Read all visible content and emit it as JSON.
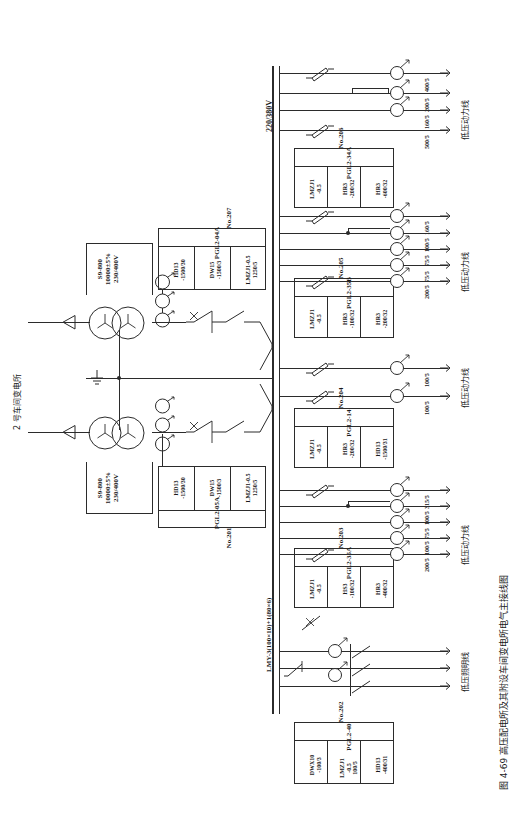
{
  "figure": {
    "caption": "图 4-69  高压配电所及其附设车间变电所电气主接线图",
    "source_label": "2 号车间变电所"
  },
  "bus": {
    "hv_label": "220/380V",
    "lv_bus_spec": "LMY-3(100×10)+1(80×6)"
  },
  "transformers": [
    {
      "id": "transformer-top",
      "model": "S9-800",
      "primary": "10000±5%",
      "secondary": "230/400V"
    },
    {
      "id": "transformer-bottom",
      "model": "S9-800",
      "primary": "10000±5%",
      "secondary": "230/400V"
    }
  ],
  "panels": [
    {
      "number": "No.207",
      "cabinet": "PGL2-04A",
      "devices": [
        {
          "type": "LMZJ1-0.5",
          "rating": "1250/5"
        },
        {
          "type": "DW15",
          "rating": "-1500/3"
        },
        {
          "type": "HD13",
          "rating": "-1500/30"
        }
      ]
    },
    {
      "number": "No.206",
      "cabinet": "PGL2-34A",
      "devices": [
        {
          "type": "HR3",
          "rating": "-600/32"
        },
        {
          "type": "HR3",
          "rating": "-200/32"
        },
        {
          "type": "LMZJ1",
          "rating": "-0.5"
        }
      ]
    },
    {
      "number": "No.205",
      "cabinet": "PGL2-35B",
      "devices": [
        {
          "type": "HR3",
          "rating": "-200/32"
        },
        {
          "type": "HR3",
          "rating": "-100/32"
        },
        {
          "type": "LMZJ1",
          "rating": "-0.5"
        }
      ]
    },
    {
      "number": "No.204",
      "cabinet": "PGL2-14",
      "devices": [
        {
          "type": "HD13",
          "rating": "-1500/31"
        },
        {
          "type": "HR3",
          "rating": "-200/32"
        },
        {
          "type": "LMZJ1",
          "rating": "-0.5"
        }
      ]
    },
    {
      "number": "No.203",
      "cabinet": "PGL2-35A",
      "devices": [
        {
          "type": "HR3",
          "rating": "-400/32"
        },
        {
          "type": "HS3",
          "rating": "-100/32"
        },
        {
          "type": "LMZJ1",
          "rating": "-0.5"
        }
      ]
    },
    {
      "number": "No.202",
      "cabinet": "PGL2-40",
      "devices": [
        {
          "type": "HD13",
          "rating": "-400/31"
        },
        {
          "type": "LMZJ1",
          "rating": "-0.5",
          "rating2": "100/5"
        },
        {
          "type": "DWX10",
          "rating": "-100/3"
        }
      ]
    },
    {
      "number": "No.201",
      "cabinet": "PGL2-05A",
      "devices": [
        {
          "type": "LMZJ1-0.5",
          "rating": "1250/5"
        },
        {
          "type": "DW15",
          "rating": "-1500/3"
        },
        {
          "type": "HD13",
          "rating": "-1500/30"
        }
      ]
    }
  ],
  "feeder_groups": [
    {
      "id": "group-207",
      "line_label": "低压动力线",
      "feeders": [
        {
          "ratio": "400/5",
          "has_ct": true
        },
        {
          "ratio": "200/5",
          "has_ct": true
        },
        {
          "ratio": "160/5",
          "has_ct": true
        },
        {
          "ratio": "500/5",
          "has_ct": false
        }
      ]
    },
    {
      "id": "group-206",
      "line_label": "低压动力线",
      "feeders": [
        {
          "ratio": "160/5",
          "has_ct": true
        },
        {
          "ratio": "100/5",
          "has_ct": true
        },
        {
          "ratio": "75/5",
          "has_ct": true
        },
        {
          "ratio": "75/5",
          "has_ct": true
        },
        {
          "ratio": "200/5",
          "has_ct": true
        }
      ]
    },
    {
      "id": "group-205",
      "line_label": "低压动力线",
      "feeders": [
        {
          "ratio": "100/5",
          "has_ct": true
        },
        {
          "ratio": "100/5",
          "has_ct": true
        }
      ]
    },
    {
      "id": "group-204",
      "line_label": "低压动力线",
      "feeders": [
        {
          "ratio": "315/5",
          "has_ct": true
        },
        {
          "ratio": "100/5",
          "has_ct": true
        },
        {
          "ratio": "75/5",
          "has_ct": true
        },
        {
          "ratio": "100/5",
          "has_ct": true
        },
        {
          "ratio": "200/5",
          "has_ct": true
        }
      ]
    },
    {
      "id": "group-202",
      "line_label": "低压照明线",
      "feeders": [
        {
          "ratio": "",
          "has_ct": false
        },
        {
          "ratio": "",
          "has_ct": false
        },
        {
          "ratio": "",
          "has_ct": false
        }
      ]
    }
  ],
  "colors": {
    "ink": "#2b2b2b",
    "paper": "#ffffff"
  }
}
